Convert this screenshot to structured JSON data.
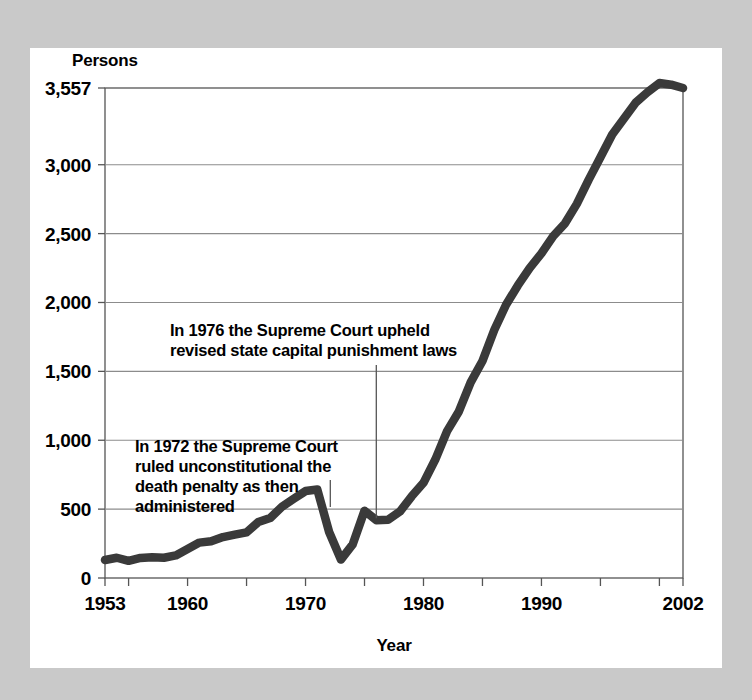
{
  "chart_data": {
    "type": "line",
    "title": "",
    "subtitle": "",
    "xlabel": "Year",
    "ylabel": "Persons",
    "ylim": [
      0,
      3557
    ],
    "xlim": [
      1953,
      2002
    ],
    "grid": true,
    "legend": "none",
    "y_ticks": [
      "0",
      "500",
      "1,000",
      "1,500",
      "2,000",
      "2,500",
      "3,000",
      "3,557"
    ],
    "y_tick_values": [
      0,
      500,
      1000,
      1500,
      2000,
      2500,
      3000,
      3557
    ],
    "x_ticks": [
      "1953",
      "1960",
      "1970",
      "1980",
      "1990",
      "2002"
    ],
    "x_tick_values": [
      1953,
      1960,
      1970,
      1980,
      1990,
      2002
    ],
    "x_minor_tick_values": [
      1955,
      1960,
      1965,
      1970,
      1975,
      1980,
      1985,
      1990,
      1995,
      2000
    ],
    "series": [
      {
        "name": "Prisoners under sentence of death",
        "color": "#3a3a3a",
        "x": [
          1953,
          1954,
          1955,
          1956,
          1957,
          1958,
          1959,
          1960,
          1961,
          1962,
          1963,
          1964,
          1965,
          1966,
          1967,
          1968,
          1969,
          1970,
          1971,
          1972,
          1973,
          1974,
          1975,
          1976,
          1977,
          1978,
          1979,
          1980,
          1981,
          1982,
          1983,
          1984,
          1985,
          1986,
          1987,
          1988,
          1989,
          1990,
          1991,
          1992,
          1993,
          1994,
          1995,
          1996,
          1997,
          1998,
          1999,
          2000,
          2001,
          2002
        ],
        "values": [
          131,
          147,
          125,
          146,
          151,
          147,
          164,
          210,
          257,
          267,
          297,
          315,
          331,
          406,
          435,
          517,
          575,
          631,
          642,
          334,
          134,
          244,
          488,
          420,
          423,
          482,
          593,
          691,
          860,
          1066,
          1209,
          1420,
          1575,
          1800,
          1984,
          2124,
          2250,
          2356,
          2482,
          2575,
          2716,
          2890,
          3054,
          3219,
          3335,
          3452,
          3527,
          3593,
          3581,
          3557
        ]
      }
    ],
    "annotations": [
      {
        "id": "anno-1976",
        "lines": [
          "In 1976 the Supreme Court upheld",
          "revised state capital punishment laws"
        ],
        "year": 1976
      },
      {
        "id": "anno-1972",
        "lines": [
          "In 1972 the Supreme Court",
          "ruled unconstitutional the",
          "death penalty as then",
          "administered"
        ],
        "year": 1972
      }
    ],
    "colors": {
      "line": "#3a3a3a",
      "grid": "#8c8c8c",
      "axis": "#555555",
      "text": "#000000",
      "plot_background": "#ffffff",
      "page_background": "#c9c9c9"
    }
  }
}
